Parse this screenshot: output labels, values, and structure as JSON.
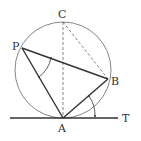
{
  "diagram": {
    "type": "geometry",
    "colors": {
      "circle": "#555555",
      "solid_line": "#333333",
      "dashed_line": "#666666",
      "label": "#333333"
    },
    "circle": {
      "cx": 63,
      "cy": 70,
      "r": 48
    },
    "points": {
      "A": {
        "x": 63,
        "y": 118,
        "label": "A"
      },
      "B": {
        "x": 108,
        "y": 79,
        "label": "B"
      },
      "C": {
        "x": 63,
        "y": 22,
        "label": "C"
      },
      "P": {
        "x": 22,
        "y": 48,
        "label": "P"
      },
      "T": {
        "x": 118,
        "y": 118,
        "label": "T"
      }
    },
    "labels": {
      "A": "A",
      "B": "B",
      "C": "C",
      "P": "P",
      "T": "T"
    },
    "segments": [
      {
        "from": "P",
        "to": "A",
        "style": "solid"
      },
      {
        "from": "P",
        "to": "B",
        "style": "solid"
      },
      {
        "from": "A",
        "to": "B",
        "style": "solid"
      },
      {
        "from": "A",
        "to": "C",
        "style": "dashed"
      },
      {
        "from": "C",
        "to": "B",
        "style": "dashed"
      },
      {
        "from": "tangent_start",
        "to": "T",
        "style": "solid",
        "note": "tangent line at A"
      }
    ],
    "angle_marks": [
      {
        "at": "P",
        "between": [
          "A",
          "B"
        ],
        "note": "inscribed angle APB"
      },
      {
        "at": "A",
        "between": [
          "B",
          "T"
        ],
        "note": "tangent-chord angle BAT"
      }
    ]
  }
}
